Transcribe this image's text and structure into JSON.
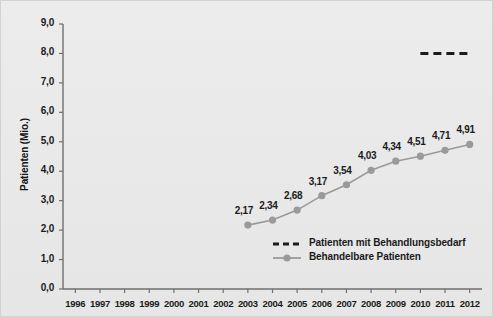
{
  "chart_data": {
    "type": "line",
    "title": "",
    "xlabel": "",
    "ylabel": "Patienten (Mio.)",
    "x": [
      1996,
      1997,
      1998,
      1999,
      2000,
      2001,
      2002,
      2003,
      2004,
      2005,
      2006,
      2007,
      2008,
      2009,
      2010,
      2011,
      2012
    ],
    "xticklabels": [
      "1996",
      "1997",
      "1998",
      "1999",
      "2000",
      "2001",
      "2002",
      "2003",
      "2004",
      "2005",
      "2006",
      "2007",
      "2008",
      "2009",
      "2010",
      "2011",
      "2012"
    ],
    "ylim": [
      0,
      9
    ],
    "yticks": [
      0,
      1,
      2,
      3,
      4,
      5,
      6,
      7,
      8,
      9
    ],
    "yticklabels": [
      "0,0",
      "1,0",
      "2,0",
      "3,0",
      "4,0",
      "5,0",
      "6,0",
      "7,0",
      "8,0",
      "9,0"
    ],
    "grid": false,
    "legend_position": "bottom-center",
    "series": [
      {
        "name": "Patienten mit Behandlungsbedarf",
        "style": "dashed",
        "color": "#1b1b1b",
        "x": [
          2010,
          2012
        ],
        "values": [
          8.0,
          8.0
        ],
        "point_labels": []
      },
      {
        "name": "Behandelbare Patienten",
        "style": "line-marker",
        "color": "#9a9a9a",
        "x": [
          2003,
          2004,
          2005,
          2006,
          2007,
          2008,
          2009,
          2010,
          2011,
          2012
        ],
        "values": [
          2.17,
          2.34,
          2.68,
          3.17,
          3.54,
          4.03,
          4.34,
          4.51,
          4.71,
          4.91
        ],
        "point_labels": [
          "2,17",
          "2,34",
          "2,68",
          "3,17",
          "3,54",
          "4,03",
          "4,34",
          "4,51",
          "4,71",
          "4,91"
        ]
      }
    ]
  }
}
